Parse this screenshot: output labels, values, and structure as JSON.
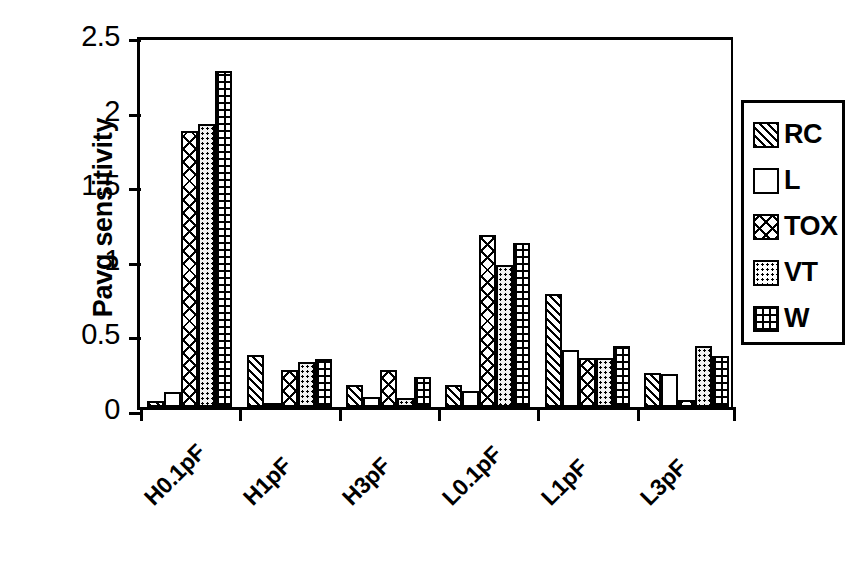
{
  "chart_data": {
    "type": "bar",
    "title": "",
    "xlabel": "",
    "ylabel": "Pavg sensitivity",
    "ylim": [
      0,
      2.5
    ],
    "ytick_labels": [
      "2.5",
      "2",
      "1.5",
      "1",
      "0.5",
      "0"
    ],
    "ytick_values": [
      2.5,
      2,
      1.5,
      1,
      0.5,
      0
    ],
    "grid": false,
    "legend_position": "right",
    "categories": [
      "H0.1pF",
      "H1pF",
      "H3pF",
      "L0.1pF",
      "L1pF",
      "L3pF"
    ],
    "series": [
      {
        "name": "RC",
        "pattern": "diagonal-hatch",
        "values": [
          0.04,
          0.35,
          0.15,
          0.15,
          0.76,
          0.23
        ]
      },
      {
        "name": "L",
        "pattern": "empty",
        "values": [
          0.1,
          0.02,
          0.07,
          0.11,
          0.38,
          0.22
        ]
      },
      {
        "name": "TOX",
        "pattern": "crosshatch",
        "values": [
          1.85,
          0.25,
          0.25,
          1.15,
          0.33,
          0.05
        ]
      },
      {
        "name": "VT",
        "pattern": "dotted",
        "values": [
          1.9,
          0.3,
          0.06,
          0.95,
          0.33,
          0.41
        ]
      },
      {
        "name": "W",
        "pattern": "grid",
        "values": [
          2.25,
          0.32,
          0.2,
          1.1,
          0.41,
          0.34
        ]
      }
    ]
  },
  "legend": {
    "entries": [
      {
        "label": "RC"
      },
      {
        "label": "L"
      },
      {
        "label": "TOX"
      },
      {
        "label": "VT"
      },
      {
        "label": "W"
      }
    ]
  },
  "colors": {
    "ink": "#000000",
    "background": "#ffffff",
    "vt_fill": "#f2f2f2"
  }
}
